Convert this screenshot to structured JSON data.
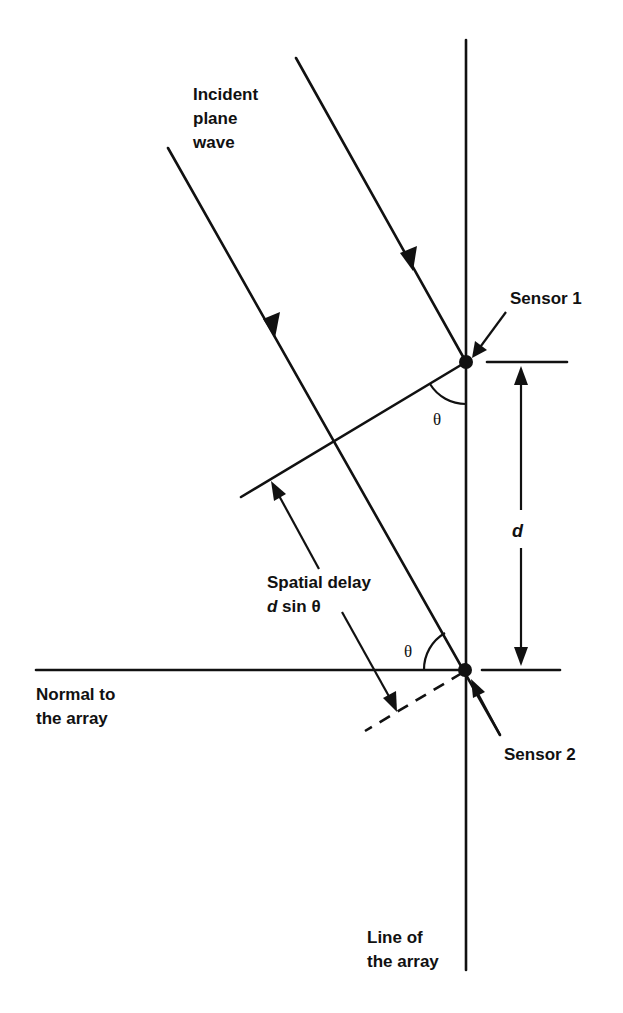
{
  "diagram": {
    "labels": {
      "incident_line1": "Incident",
      "incident_line2": "plane",
      "incident_line3": "wave",
      "sensor1": "Sensor 1",
      "sensor2": "Sensor 2",
      "d": "d",
      "spatial_delay_line1": "Spatial delay",
      "spatial_delay_d": "d",
      "spatial_delay_rest": " sin θ",
      "theta_top": "θ",
      "theta_bottom": "θ",
      "normal_line1": "Normal to",
      "normal_line2": "the array",
      "array_line1": "Line of",
      "array_line2": "the array"
    },
    "elements": {
      "line_of_array": {
        "x": 466,
        "y1": 40,
        "y2": 970
      },
      "normal_to_array": {
        "y": 670,
        "x1": 36,
        "x2": 466
      },
      "sensor1": {
        "x": 466,
        "y": 362
      },
      "sensor2": {
        "x": 466,
        "y": 670
      },
      "ray1": {
        "from": [
          296,
          58
        ],
        "to": [
          466,
          362
        ]
      },
      "ray2": {
        "from": [
          168,
          148
        ],
        "to": [
          500,
          735
        ]
      },
      "wavefront": {
        "from": [
          241,
          497
        ],
        "to": [
          466,
          362
        ]
      },
      "dashed_wavefront": {
        "from": [
          466,
          670
        ],
        "to": [
          365,
          732
        ]
      },
      "spacing_d_arrow": {
        "x": 520,
        "y_top": 362,
        "y_bottom": 670
      }
    },
    "colors": {
      "ink": "#111111",
      "background": "#ffffff"
    }
  }
}
